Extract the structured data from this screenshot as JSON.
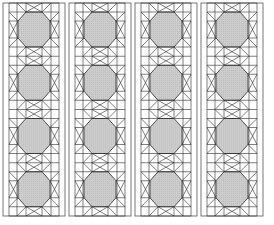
{
  "figure": {
    "type": "quilt-pattern",
    "strip_count": 4,
    "blocks_per_strip": 4,
    "strip_left_positions": [
      3,
      69,
      135,
      201
    ],
    "strip_top": 3,
    "strip_width": 62,
    "strip_height": 213,
    "margin": 6,
    "block_height": 53.25
  },
  "colors": {
    "line": "#2a2a2a",
    "fill": "#c9c9c9",
    "background": "#ffffff",
    "border": "#555555"
  }
}
